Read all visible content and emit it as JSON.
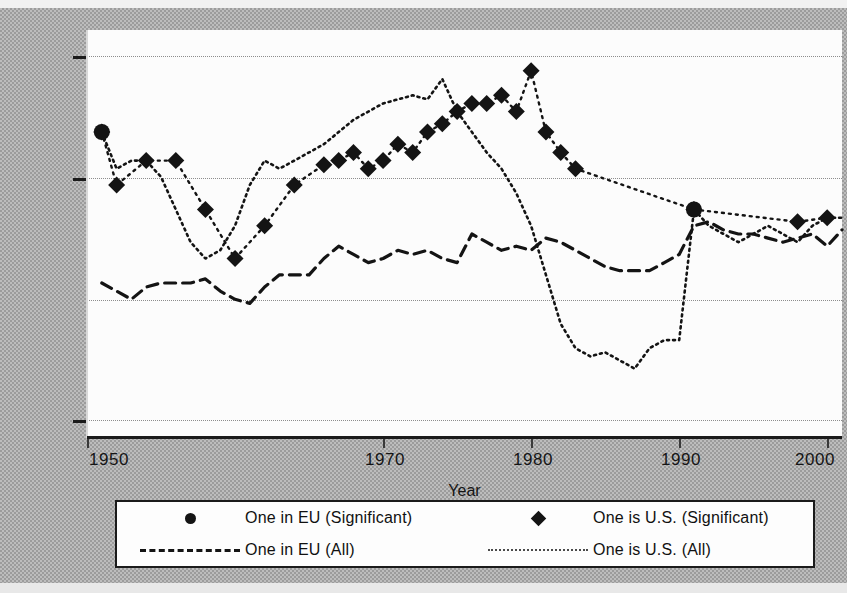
{
  "figure": {
    "background_color": "#aaaaaa",
    "plot_background_color": "#fcfcfc",
    "line_color": "#141414"
  },
  "axis": {
    "x_title": "Year",
    "x_ticks": [
      "1950",
      "1970",
      "1980",
      "1990",
      "2000"
    ],
    "x_tick_values": [
      1950,
      1970,
      1980,
      1990,
      2000
    ],
    "y_ticks": [
      "",
      "",
      ""
    ]
  },
  "legend": {
    "entries": [
      {
        "label": "One in EU (Significant)",
        "marker": "circle-marker",
        "style": "dotted"
      },
      {
        "label": "One is U.S. (Significant)",
        "marker": "diamond-marker",
        "style": "dotted"
      },
      {
        "label": "One in EU (All)",
        "marker": "dashed-line",
        "style": "dashed"
      },
      {
        "label": "One is U.S. (All)",
        "marker": "dotted-line",
        "style": "dotted"
      }
    ]
  },
  "chart_data": {
    "type": "line",
    "title": "",
    "subtitle": "",
    "xlabel": "Year",
    "ylabel": "",
    "grid": true,
    "legend_position": "bottom",
    "xlim": [
      1949,
      2000
    ],
    "ylim": [
      0,
      100
    ],
    "gridline_y_values": [
      90,
      70,
      40,
      8
    ],
    "x_tick_labels": [
      "1950",
      "1970",
      "1980",
      "1990",
      "2000"
    ],
    "y_tick_values": [
      90,
      70,
      8
    ],
    "note": "y-axis tick labels are not printed on the scanned figure; y values below are read off the four dotted gridlines on a 0-100 relative scale",
    "series": [
      {
        "name": "One is U.S. (Significant)",
        "marker": "diamond",
        "style": "dotted",
        "x": [
          1950,
          1951,
          1953,
          1955,
          1957,
          1959,
          1961,
          1963,
          1965,
          1966,
          1967,
          1968,
          1969,
          1970,
          1971,
          1972,
          1973,
          1974,
          1975,
          1976,
          1977,
          1978,
          1979,
          1980,
          1981,
          1982,
          1990,
          1997,
          1999
        ],
        "y": [
          75,
          62,
          68,
          68,
          56,
          44,
          52,
          62,
          67,
          68,
          70,
          66,
          68,
          72,
          70,
          75,
          77,
          80,
          82,
          82,
          84,
          80,
          90,
          75,
          70,
          66,
          56,
          53,
          54
        ]
      },
      {
        "name": "One in EU (All)",
        "marker": "none",
        "style": "dashed",
        "x": [
          1950,
          1951,
          1952,
          1953,
          1954,
          1955,
          1956,
          1957,
          1958,
          1959,
          1960,
          1961,
          1962,
          1963,
          1964,
          1965,
          1966,
          1967,
          1968,
          1969,
          1970,
          1971,
          1972,
          1973,
          1974,
          1975,
          1976,
          1977,
          1978,
          1979,
          1980,
          1981,
          1982,
          1983,
          1984,
          1985,
          1986,
          1987,
          1988,
          1989,
          1990,
          1991,
          1992,
          1993,
          1994,
          1995,
          1996,
          1997,
          1998,
          1999,
          2000
        ],
        "y": [
          38,
          36,
          34,
          37,
          38,
          38,
          38,
          39,
          36,
          34,
          33,
          37,
          40,
          40,
          40,
          44,
          47,
          45,
          43,
          44,
          46,
          45,
          46,
          44,
          43,
          50,
          48,
          46,
          47,
          46,
          49,
          48,
          46,
          44,
          42,
          41,
          41,
          41,
          43,
          45,
          52,
          53,
          51,
          50,
          50,
          49,
          48,
          49,
          50,
          47,
          51
        ]
      },
      {
        "name": "One is U.S. (All)",
        "marker": "none",
        "style": "dotted",
        "x": [
          1950,
          1951,
          1952,
          1953,
          1954,
          1955,
          1956,
          1957,
          1958,
          1959,
          1960,
          1961,
          1962,
          1963,
          1964,
          1965,
          1966,
          1967,
          1968,
          1969,
          1970,
          1971,
          1972,
          1973,
          1974,
          1975,
          1976,
          1977,
          1978,
          1979,
          1980,
          1981,
          1982,
          1983,
          1984,
          1985,
          1986,
          1987,
          1988,
          1989,
          1990,
          1991,
          1992,
          1993,
          1994,
          1995,
          1996,
          1997,
          1998,
          1999,
          2000
        ],
        "y": [
          75,
          66,
          68,
          68,
          64,
          56,
          48,
          44,
          46,
          52,
          62,
          68,
          66,
          68,
          70,
          72,
          75,
          78,
          80,
          82,
          83,
          84,
          83,
          88,
          80,
          75,
          70,
          66,
          60,
          52,
          40,
          28,
          22,
          20,
          21,
          19,
          17,
          22,
          24,
          24,
          56,
          52,
          50,
          48,
          50,
          52,
          50,
          48,
          52,
          54,
          54
        ]
      }
    ],
    "markers": {
      "One in EU (Significant)": {
        "x": [
          1990,
          1950
        ],
        "y": [
          56,
          75
        ]
      }
    }
  }
}
